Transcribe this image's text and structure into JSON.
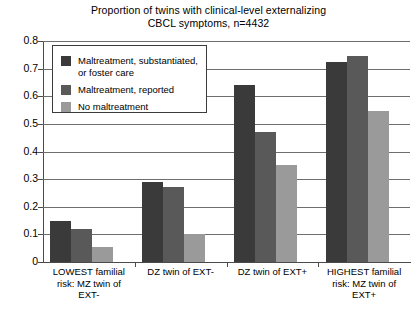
{
  "chart_data": {
    "type": "bar",
    "title": "Proportion of twins with clinical-level externalizing CBCL symptoms, n=4432",
    "title_lines": [
      "Proportion of twins with clinical-level externalizing",
      "CBCL symptoms, n=4432"
    ],
    "xlabel": "",
    "ylabel": "",
    "ylim": [
      0,
      0.8
    ],
    "grid": true,
    "legend_position": "upper-left-inside",
    "categories": [
      "LOWEST familial risk: MZ twin of EXT-",
      "DZ twin of EXT-",
      "DZ twin of EXT+",
      "HIGHEST familial risk: MZ twin of EXT+"
    ],
    "category_label_lines": [
      [
        "LOWEST familial",
        "risk: MZ twin of",
        "EXT-"
      ],
      [
        "DZ twin of EXT-"
      ],
      [
        "DZ twin of EXT+"
      ],
      [
        "HIGHEST familial",
        "risk: MZ twin of",
        "EXT+"
      ]
    ],
    "ytick_labels": [
      "0.8",
      "0.7",
      "0.6",
      "0.5",
      "0.4",
      "0.3",
      "0.2",
      "0.1",
      "0"
    ],
    "ytick_values": [
      0.8,
      0.7,
      0.6,
      0.5,
      0.4,
      0.3,
      0.2,
      0.1,
      0
    ],
    "series": [
      {
        "name": "Maltreatment, substantiated, or foster care",
        "name_lines": [
          "Maltreatment, substantiated,",
          "or foster care"
        ],
        "color": "#3a3a3a",
        "values": [
          0.15,
          0.29,
          0.64,
          0.725
        ]
      },
      {
        "name": "Maltreatment, reported",
        "name_lines": [
          "Maltreatment, reported"
        ],
        "color": "#595959",
        "values": [
          0.12,
          0.27,
          0.47,
          0.745
        ]
      },
      {
        "name": "No maltreatment",
        "name_lines": [
          "No maltreatment"
        ],
        "color": "#9a9a9a",
        "values": [
          0.055,
          0.1,
          0.35,
          0.545
        ]
      }
    ]
  }
}
